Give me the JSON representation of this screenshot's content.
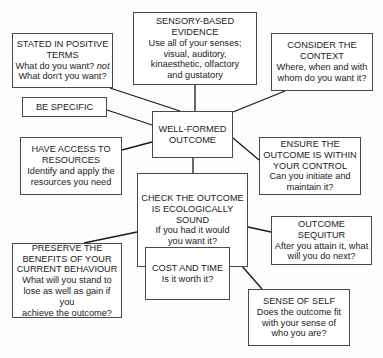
{
  "diagram": {
    "center": {
      "title": "WELL-FORMED OUTCOME"
    },
    "nodes": {
      "stated": {
        "title1": "STATED IN POSITIVE",
        "title2": "TERMS",
        "desc1": "What do you want?",
        "desc1_em": "not",
        "desc2": "What don't you want?"
      },
      "sensory": {
        "title1": "SENSORY-BASED",
        "title2": "EVIDENCE",
        "desc1": "Use all of your senses;",
        "desc2": "visual, auditory,",
        "desc3": "kinaesthetic, olfactory",
        "desc4": "and gustatory"
      },
      "context": {
        "title1": "CONSIDER THE",
        "title2": "CONTEXT",
        "desc1": "Where, when and with",
        "desc2": "whom do you want it?"
      },
      "specific": {
        "title": "BE SPECIFIC"
      },
      "center": {
        "title1": "WELL-FORMED",
        "title2": "OUTCOME"
      },
      "resources": {
        "title1": "HAVE ACCESS TO",
        "title2": "RESOURCES",
        "desc1": "Identify and apply the",
        "desc2": "resources you need"
      },
      "control": {
        "title1": "ENSURE THE",
        "title2": "OUTCOME IS WITHIN",
        "title3": "YOUR CONTROL",
        "desc1": "Can you initiate and",
        "desc2": "maintain it?"
      },
      "ecology": {
        "title1": "CHECK THE OUTCOME",
        "title2": "IS ECOLOGICALLY",
        "title3": "SOUND",
        "desc1": "If you had it would",
        "desc2": "you want it?"
      },
      "sequitur": {
        "title": "OUTCOME SEQUITUR",
        "desc1": "After you attain it, what",
        "desc2": "will you do next?"
      },
      "preserve": {
        "title1": "PRESERVE THE",
        "title2": "BENEFITS OF YOUR",
        "title3": "CURRENT BEHAVIOUR",
        "desc1": "What will you stand to",
        "desc2": "lose as well as gain if you",
        "desc3": "achieve the outcome?"
      },
      "cost": {
        "title": "COST AND TIME",
        "desc": "Is it worth it?"
      },
      "self": {
        "title": "SENSE OF SELF",
        "desc1": "Does the outcome fit",
        "desc2": "with your sense of",
        "desc3": "who you are?"
      }
    },
    "colors": {
      "border": "#4a4a4a",
      "line": "#1a1a1a",
      "text": "#222222",
      "background": "#ffffff"
    }
  }
}
